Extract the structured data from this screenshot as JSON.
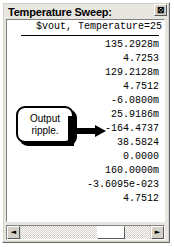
{
  "window": {
    "title": "Temperature Sweep:",
    "close_label": "⊠"
  },
  "content": {
    "column_header": "$vout, Temperature=25",
    "rows": [
      "135.2928m",
      "4.7253",
      "129.2128m",
      "4.7512",
      "-6.0800m",
      "25.9186m",
      "-164.4737",
      "38.5824",
      "0.0000",
      "160.0000m",
      "-3.6095e-023",
      "4.7512"
    ]
  },
  "annotation": {
    "line1": "Output",
    "line2": "ripple.",
    "points_to_row_index": 5
  },
  "scrollbar": {
    "left_arrow": "◄",
    "right_arrow": "►"
  }
}
